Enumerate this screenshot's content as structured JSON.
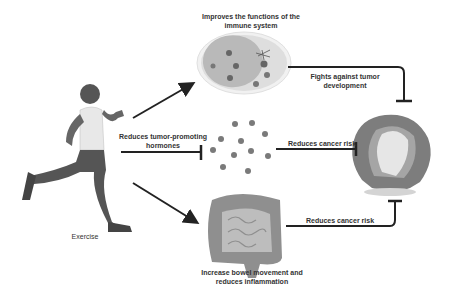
{
  "diagram": {
    "source_node": {
      "label": "Exercise",
      "icon": "running-person-icon"
    },
    "nodes": [
      {
        "id": "immune",
        "label_line1": "Improves the functions of the",
        "label_line2": "immune system",
        "icon": "immune-cells-icon"
      },
      {
        "id": "hormones",
        "label_line1": "Reduces tumor-promoting",
        "label_line2": "hormones",
        "icon": "hormone-dots-icon"
      },
      {
        "id": "bowel",
        "label_line1": "Increase bowel movement and",
        "label_line2": "reduces inflammation",
        "icon": "intestine-icon"
      }
    ],
    "target_node": {
      "icon": "tumor-icon"
    },
    "edges": [
      {
        "from": "exercise",
        "to": "immune",
        "type": "arrow"
      },
      {
        "from": "exercise",
        "to": "hormones",
        "type": "inhibit",
        "label": "Reduces tumor-promoting hormones"
      },
      {
        "from": "exercise",
        "to": "bowel",
        "type": "arrow"
      },
      {
        "from": "immune",
        "to": "tumor",
        "type": "inhibit",
        "label_line1": "Fights against tumor",
        "label_line2": "development"
      },
      {
        "from": "hormones",
        "to": "tumor",
        "type": "inhibit",
        "label": "Reduces cancer risk"
      },
      {
        "from": "bowel",
        "to": "tumor",
        "type": "inhibit",
        "label": "Reduces cancer risk"
      }
    ]
  },
  "colors": {
    "line": "#222222",
    "text": "#333333",
    "dot": "#7a7a7a",
    "tissue": "#8a8a8a",
    "light": "#d6d6d6"
  }
}
